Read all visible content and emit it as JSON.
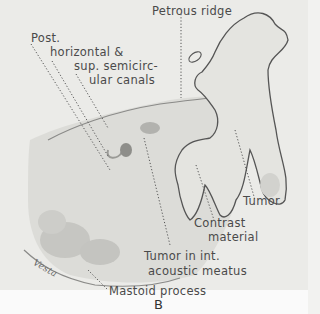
{
  "figure": {
    "panel_label": "B",
    "labels": {
      "petrous_ridge": "Petrous ridge",
      "canals_line1": "Post.",
      "canals_line2": "horizontal &",
      "canals_line3": "sup. semicirc-",
      "canals_line4": "ular canals",
      "tumor": "Tumor",
      "contrast_line1": "Contrast",
      "contrast_line2": "material",
      "meatus_line1": "Tumor in int.",
      "meatus_line2": "acoustic meatus",
      "mastoid": "Mastoid process"
    },
    "signature": "Vesta"
  }
}
